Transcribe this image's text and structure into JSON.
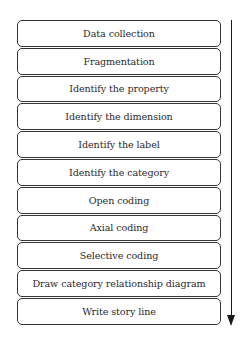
{
  "diagram": {
    "type": "vertical-process-flow",
    "steps": [
      {
        "label": "Data collection"
      },
      {
        "label": "Fragmentation"
      },
      {
        "label": "Identify the property"
      },
      {
        "label": "Identify the dimension"
      },
      {
        "label": "Identify the label"
      },
      {
        "label": "Identify the category"
      },
      {
        "label": "Open coding"
      },
      {
        "label": "Axial coding"
      },
      {
        "label": "Selective coding"
      },
      {
        "label": "Draw category relationship diagram"
      },
      {
        "label": "Write story line"
      }
    ],
    "arrow": {
      "direction": "down",
      "icon": "arrow-down-icon"
    },
    "colors": {
      "border": "#333333",
      "text": "#2a2a2a",
      "arrow": "#1a1a1a",
      "background": "#ffffff"
    }
  }
}
